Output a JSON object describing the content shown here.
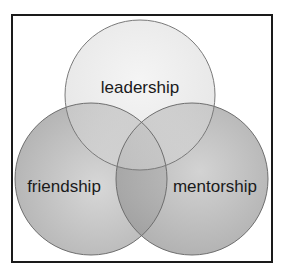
{
  "diagram": {
    "type": "venn",
    "sets": [
      {
        "id": "top",
        "label": "leadership",
        "cx": 140,
        "cy": 95,
        "r": 75,
        "color": "#d8d8d8"
      },
      {
        "id": "left",
        "label": "friendship",
        "cx": 91,
        "cy": 179,
        "r": 76,
        "color": "#a8a8a8"
      },
      {
        "id": "right",
        "label": "mentorship",
        "cx": 192,
        "cy": 179,
        "r": 76,
        "color": "#9a9a9a"
      }
    ],
    "outline_color": "#6e6e6e",
    "frame_color": "#1a1a1a"
  }
}
